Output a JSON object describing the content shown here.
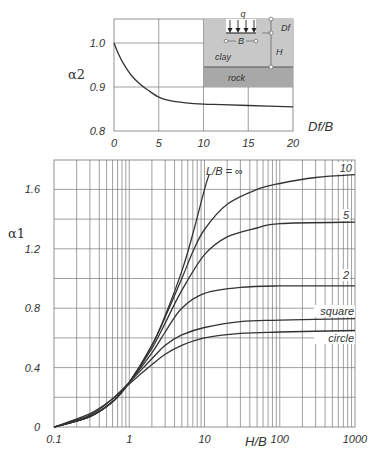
{
  "chart_data": [
    {
      "type": "line",
      "title": "",
      "xlabel": "Df/B",
      "ylabel": "α2",
      "xlim": [
        0,
        20
      ],
      "ylim": [
        0.8,
        1.055
      ],
      "grid": true,
      "x_ticks": [
        "0",
        "5",
        "10",
        "15",
        "20"
      ],
      "y_ticks": [
        "0.8",
        "0.9",
        "1.0"
      ],
      "series": [
        {
          "name": "α2",
          "x": [
            0,
            0.5,
            1,
            2,
            3,
            4,
            5,
            6,
            8,
            10,
            12,
            15,
            20
          ],
          "y": [
            1.0,
            0.975,
            0.955,
            0.925,
            0.905,
            0.89,
            0.877,
            0.87,
            0.864,
            0.861,
            0.86,
            0.858,
            0.855
          ]
        }
      ],
      "inset": {
        "labels": {
          "load": "q",
          "width": "B",
          "depth": "Df",
          "thickness": "H",
          "soil": "clay",
          "base": "rock"
        }
      }
    },
    {
      "type": "line",
      "title": "",
      "xlabel": "H/B",
      "ylabel": "α1",
      "xscale": "log",
      "xlim": [
        0.1,
        1000
      ],
      "ylim": [
        0,
        1.8
      ],
      "grid": true,
      "x_ticks": [
        "0.1",
        "1",
        "10",
        "100",
        "1000"
      ],
      "y_ticks": [
        "0",
        "0.4",
        "0.8",
        "1.2",
        "1.6"
      ],
      "series": [
        {
          "name": "L/B = ∞",
          "x": [
            0.1,
            0.3,
            0.6,
            1,
            2,
            3,
            5,
            7,
            10,
            11.5
          ],
          "y": [
            0,
            0.07,
            0.17,
            0.3,
            0.55,
            0.75,
            1.05,
            1.3,
            1.6,
            1.7
          ]
        },
        {
          "name": "10",
          "x": [
            0.1,
            0.3,
            0.6,
            1,
            2,
            3,
            5,
            7,
            10,
            20,
            50,
            100,
            300,
            1000
          ],
          "y": [
            0,
            0.07,
            0.17,
            0.3,
            0.55,
            0.74,
            1.0,
            1.18,
            1.33,
            1.5,
            1.6,
            1.64,
            1.68,
            1.7
          ]
        },
        {
          "name": "5",
          "x": [
            0.1,
            0.3,
            0.6,
            1,
            2,
            3,
            5,
            10,
            20,
            50,
            100,
            1000
          ],
          "y": [
            0,
            0.07,
            0.17,
            0.3,
            0.53,
            0.7,
            0.92,
            1.16,
            1.28,
            1.34,
            1.37,
            1.38
          ]
        },
        {
          "name": "2",
          "x": [
            0.1,
            0.3,
            0.6,
            1,
            2,
            3,
            5,
            10,
            30,
            100,
            1000
          ],
          "y": [
            0,
            0.07,
            0.17,
            0.3,
            0.5,
            0.64,
            0.8,
            0.9,
            0.94,
            0.95,
            0.95
          ]
        },
        {
          "name": "square",
          "x": [
            0.1,
            0.3,
            0.6,
            1,
            2,
            3,
            5,
            10,
            30,
            100,
            1000
          ],
          "y": [
            0,
            0.08,
            0.19,
            0.3,
            0.46,
            0.55,
            0.62,
            0.67,
            0.71,
            0.72,
            0.73
          ]
        },
        {
          "name": "circle",
          "x": [
            0.1,
            0.3,
            0.6,
            1,
            2,
            3,
            5,
            10,
            30,
            100,
            1000
          ],
          "y": [
            0,
            0.09,
            0.19,
            0.29,
            0.42,
            0.49,
            0.55,
            0.6,
            0.63,
            0.64,
            0.65
          ]
        }
      ]
    }
  ]
}
